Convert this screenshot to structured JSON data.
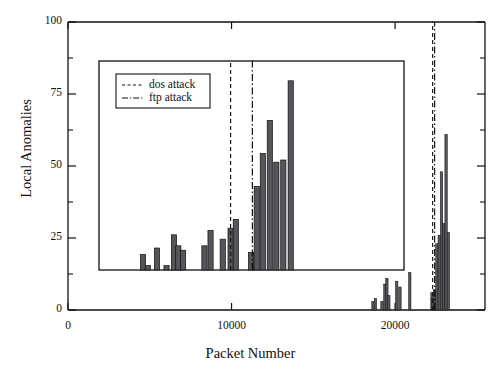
{
  "chart_data": {
    "type": "bar",
    "title": "",
    "xlabel": "Packet Number",
    "ylabel": "Local Anomalies",
    "xlim": [
      0,
      25500
    ],
    "ylim": [
      0,
      100
    ],
    "xticks": [
      0,
      10000,
      20000
    ],
    "xtick_labels": [
      "0",
      "10000",
      "20000"
    ],
    "yticks": [
      0,
      25,
      50,
      75,
      100
    ],
    "ytick_labels": [
      "0",
      "25",
      "50",
      "75",
      "100"
    ],
    "yminor_ticks": [
      12.5,
      37.5,
      62.5,
      87.5
    ],
    "grid": false,
    "legend_position": "inset-top-left",
    "legend": [
      {
        "label": "dos attack",
        "style": "dashed"
      },
      {
        "label": "ftp attack",
        "style": "dashdot"
      }
    ],
    "bar_color": "#55555a",
    "line_color": "#111111",
    "annotations": [
      {
        "label": "dos attack",
        "type": "vline",
        "style": "dashed",
        "x": 22300
      },
      {
        "label": "ftp attack",
        "type": "vline",
        "style": "dashdot",
        "x": 22420
      }
    ],
    "x": [
      18650,
      18800,
      19200,
      19380,
      19500,
      19620,
      20100,
      20300,
      20900,
      22260,
      22300,
      22420,
      22560,
      22700,
      22840,
      22980,
      23120,
      23260
    ],
    "values": [
      3,
      4,
      3,
      9,
      11,
      5,
      10,
      8,
      13,
      6,
      4,
      7,
      23,
      26,
      48,
      30,
      61,
      27
    ],
    "series": [
      {
        "name": "Local Anomalies (main)",
        "x": [
          18650,
          18800,
          19200,
          19380,
          19500,
          19620,
          20100,
          20300,
          20900,
          22260,
          22300,
          22420,
          22560,
          22700,
          22840,
          22980,
          23120,
          23260
        ],
        "values": [
          3,
          4,
          3,
          9,
          11,
          5,
          10,
          8,
          13,
          6,
          4,
          7,
          23,
          26,
          48,
          30,
          61,
          27
        ]
      }
    ],
    "inset": {
      "xlim": [
        17000,
        24000
      ],
      "ylim": [
        0,
        95
      ],
      "xticks": [],
      "yticks": [],
      "annotations": [
        {
          "label": "dos attack",
          "type": "vline",
          "style": "dashed",
          "x": 20020
        },
        {
          "label": "ftp attack",
          "type": "vline",
          "style": "dashdot",
          "x": 20520
        }
      ],
      "x": [
        18010,
        18120,
        18330,
        18550,
        18720,
        18820,
        18930,
        19420,
        19560,
        19840,
        20020,
        20140,
        20490,
        20620,
        20760,
        20920,
        21070,
        21230,
        21400
      ],
      "values": [
        7,
        2,
        10,
        2,
        16,
        11,
        9,
        11,
        18,
        14,
        19,
        23,
        8,
        38,
        53,
        68,
        49,
        50,
        86
      ]
    }
  },
  "figure": {
    "xlabel": "Packet Number",
    "ylabel": "Local Anomalies",
    "ytick_0": "0",
    "ytick_25": "25",
    "ytick_50": "50",
    "ytick_75": "75",
    "ytick_100": "100",
    "xtick_0": "0",
    "xtick_10000": "10000",
    "xtick_20000": "20000",
    "legend_dos": "dos attack",
    "legend_ftp": "ftp attack"
  }
}
